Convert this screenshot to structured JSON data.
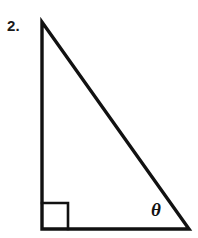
{
  "figure": {
    "problem_number": "2.",
    "angle_label": "θ",
    "colors": {
      "background": "#ffffff",
      "stroke": "#111111",
      "label": "#1a1a1a"
    },
    "stroke_width": 3.4,
    "right_angle_marker": {
      "name": "right-angle-square",
      "size": 26,
      "stroke_width": 2.6
    },
    "vertices": {
      "apex": {
        "x": 42,
        "y": 22
      },
      "bottom_left": {
        "x": 42,
        "y": 229
      },
      "bottom_right": {
        "x": 189,
        "y": 229
      }
    },
    "edges": [
      {
        "name": "vertical-leg",
        "from": "apex",
        "to": "bottom_left"
      },
      {
        "name": "horizontal-leg",
        "from": "bottom_left",
        "to": "bottom_right"
      },
      {
        "name": "hypotenuse",
        "from": "apex",
        "to": "bottom_right"
      }
    ]
  }
}
